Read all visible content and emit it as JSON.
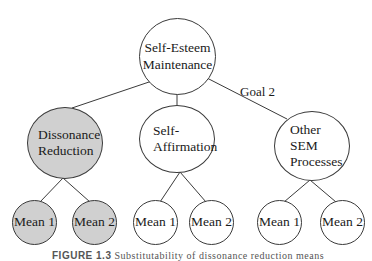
{
  "diagram": {
    "root": {
      "lines": [
        "Self-Esteem",
        "Maintenance"
      ]
    },
    "edge_label": "Goal 2",
    "branches": [
      {
        "lines": [
          "Dissonance",
          "Reduction"
        ],
        "shaded": true,
        "means": [
          "Mean 1",
          "Mean 2"
        ]
      },
      {
        "lines": [
          "Self-",
          "Affirmation"
        ],
        "shaded": false,
        "means": [
          "Mean 1",
          "Mean 2"
        ]
      },
      {
        "lines": [
          "Other",
          "SEM",
          "Processes"
        ],
        "shaded": false,
        "means": [
          "Mean 1",
          "Mean 2"
        ]
      }
    ],
    "colors": {
      "shaded_fill": "#d0d0d0",
      "line": "#3a3a3a"
    }
  },
  "caption": {
    "label": "FIGURE 1.3",
    "text": "Substitutability of dissonance reduction means"
  }
}
